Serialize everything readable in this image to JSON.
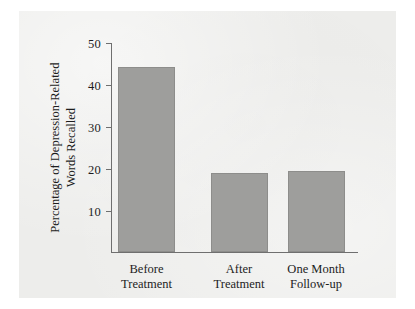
{
  "chart_data": {
    "type": "bar",
    "title": "",
    "subtitle": "",
    "xlabel": "",
    "ylabel": "Percentage of Depression-Related Words Recalled",
    "ylabel_lines": [
      "Percentage of Depression-Related",
      "Words Recalled"
    ],
    "categories": [
      "Before Treatment",
      "After Treatment",
      "One Month Follow-up"
    ],
    "category_lines": [
      [
        "Before",
        "Treatment"
      ],
      [
        "After",
        "Treatment"
      ],
      [
        "One Month",
        "Follow-up"
      ]
    ],
    "values": [
      44,
      18.7,
      19.1
    ],
    "ylim": [
      0,
      50
    ],
    "yticks": [
      10,
      20,
      30,
      40,
      50
    ],
    "ytick_labels": [
      "10",
      "20",
      "30",
      "40",
      "50"
    ],
    "grid": false,
    "legend": false,
    "legend_position": "none",
    "bar_color": "#9e9e9c",
    "bar_edge_color": "#8d8d8b",
    "axis_color": "#6f6f6f",
    "text_color": "#1d1d1d",
    "panel_color": "#ededeb",
    "background_color": "#ffffff"
  }
}
